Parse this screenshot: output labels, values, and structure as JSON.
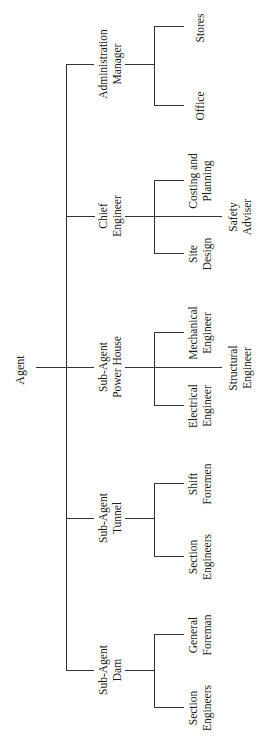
{
  "chart": {
    "root": {
      "label": "Agent"
    },
    "branches": [
      {
        "id": "admin",
        "lines": [
          "Administration",
          "Manager"
        ],
        "children": [
          {
            "lines": [
              "Stores"
            ]
          },
          {
            "lines": [
              "Office"
            ]
          }
        ]
      },
      {
        "id": "chief",
        "lines": [
          "Chief",
          "Engineer"
        ],
        "children": [
          {
            "lines": [
              "Costing and",
              "Planning"
            ]
          },
          {
            "lines": [
              "Site",
              "Design"
            ]
          }
        ],
        "center_child": {
          "lines": [
            "Safety",
            "Adviser"
          ]
        }
      },
      {
        "id": "powerhouse",
        "lines": [
          "Sub-Agent",
          "Power House"
        ],
        "children": [
          {
            "lines": [
              "Mechanical",
              "Engineer"
            ]
          },
          {
            "lines": [
              "Electrical",
              "Engineer"
            ]
          }
        ],
        "center_child": {
          "lines": [
            "Structural",
            "Engineer"
          ]
        }
      },
      {
        "id": "tunnel",
        "lines": [
          "Sub-Agent",
          "Tunnel"
        ],
        "children": [
          {
            "lines": [
              "Shift",
              "Foremen"
            ]
          },
          {
            "lines": [
              "Section",
              "Engineers"
            ]
          }
        ]
      },
      {
        "id": "dam",
        "lines": [
          "Sub-Agent",
          "Dam"
        ],
        "children": [
          {
            "lines": [
              "General",
              "Foreman"
            ]
          },
          {
            "lines": [
              "Section",
              "Engineers"
            ]
          }
        ]
      }
    ]
  }
}
